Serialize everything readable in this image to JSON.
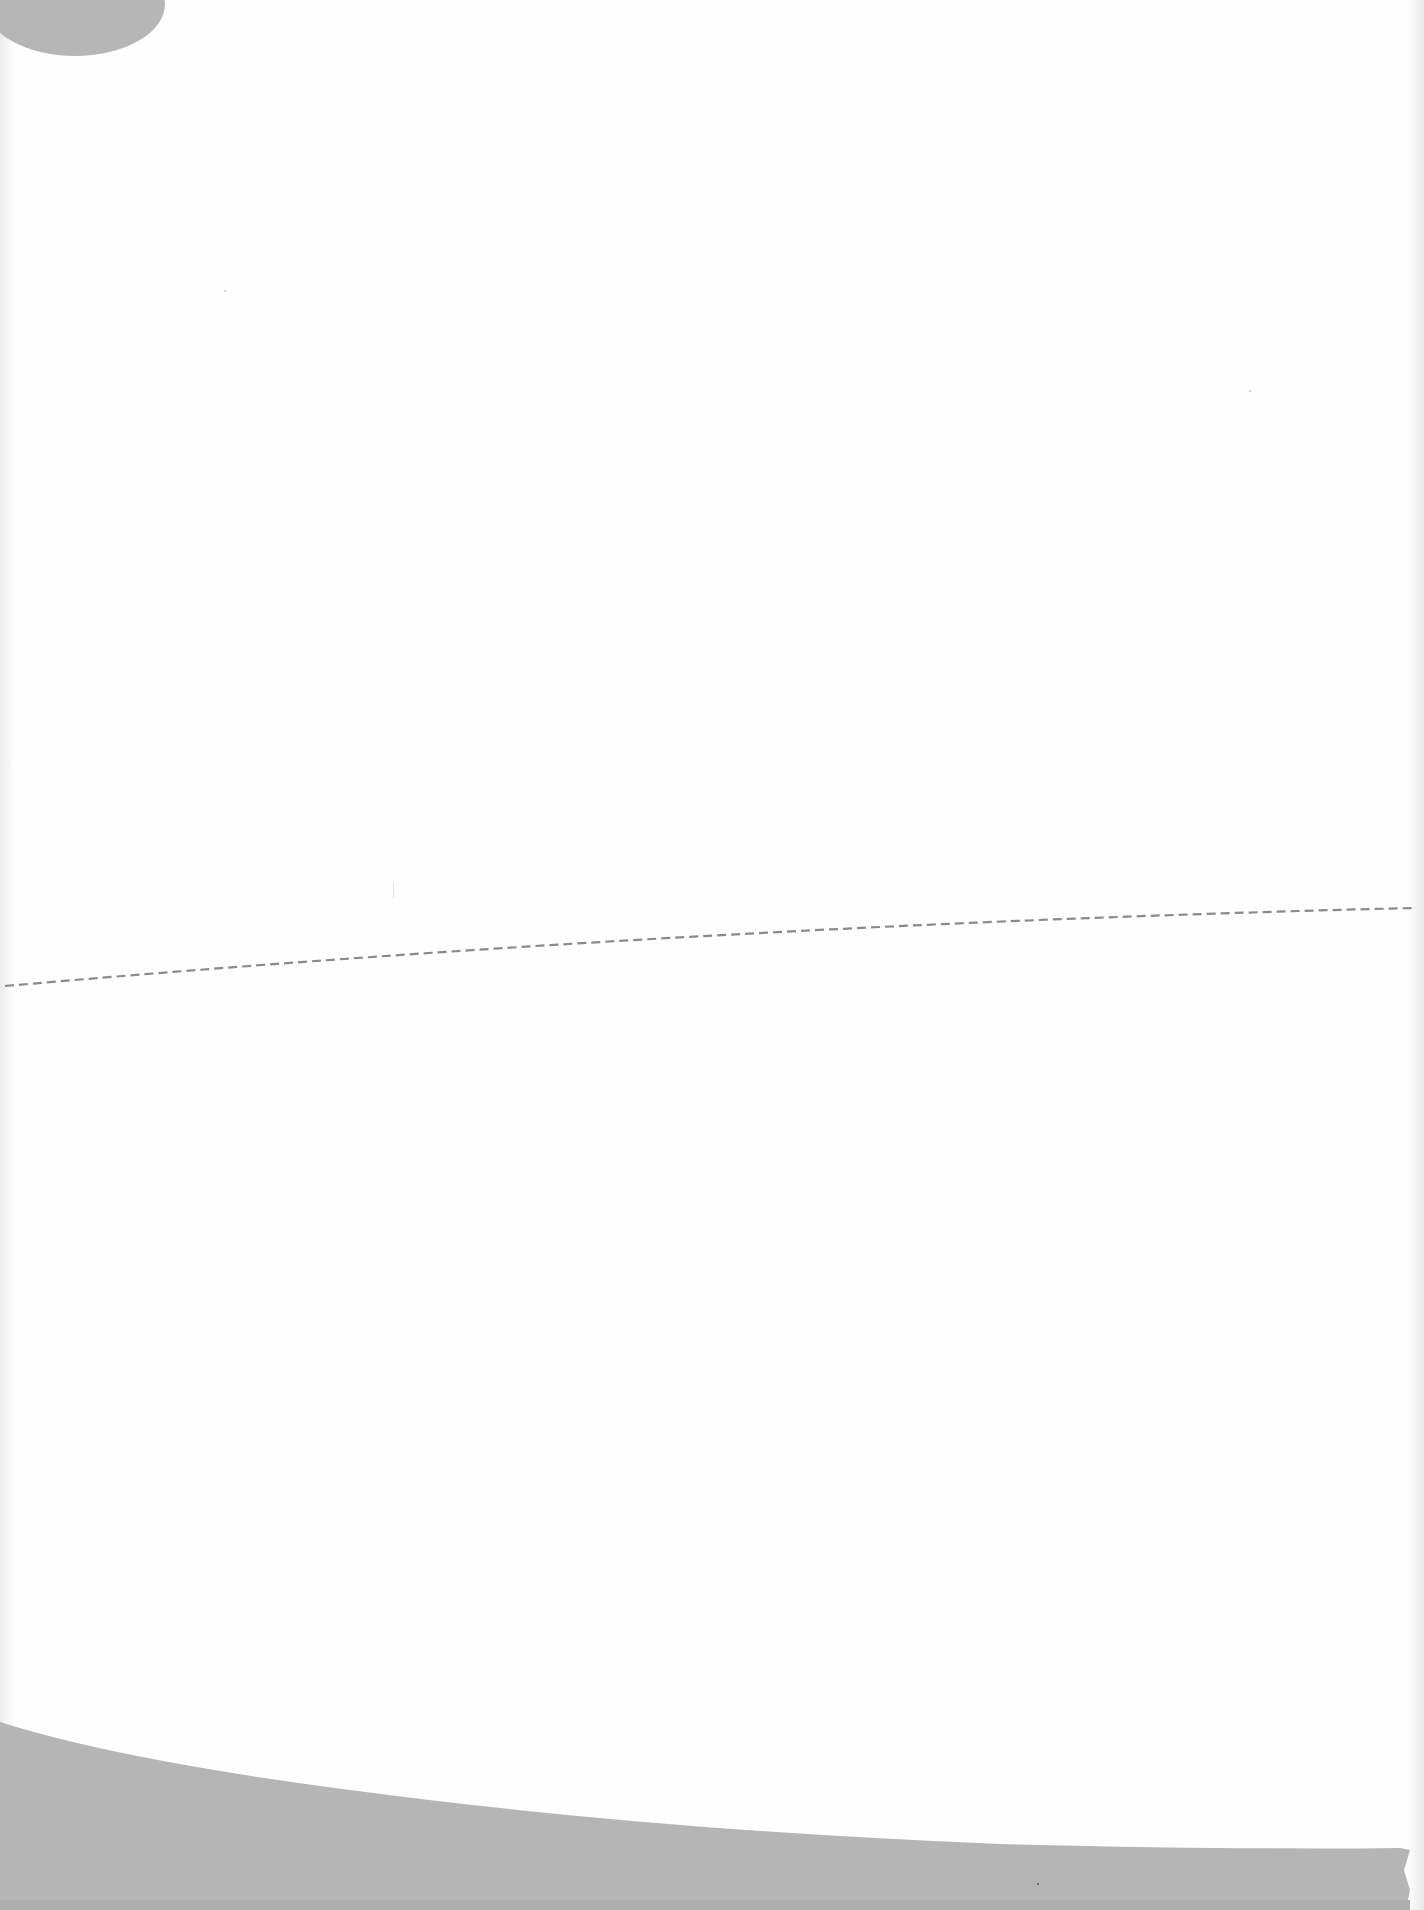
{
  "document": {
    "type": "scanned blank page",
    "text_content": ""
  },
  "colors": {
    "page_background": "#fefefe",
    "scan_shadow": "#b5b5b5",
    "dashed_line": "#8a8a8a"
  },
  "annotations": {
    "dashed_line": {
      "description": "dashed cut/fold guide line",
      "start": [
        5,
        986
      ],
      "end": [
        1414,
        908
      ],
      "dash": 9,
      "gap": 5
    }
  }
}
